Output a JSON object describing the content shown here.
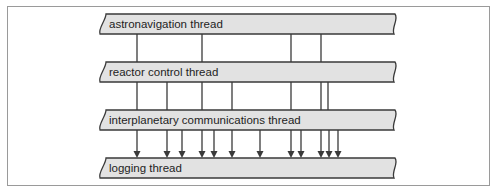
{
  "diagram": {
    "threads": [
      {
        "label": "astronavigation thread",
        "y": 14
      },
      {
        "label": "reactor control thread",
        "y": 62
      },
      {
        "label": "interplanetary communications thread",
        "y": 110
      },
      {
        "label": "logging thread",
        "y": 158
      }
    ],
    "connections": [
      {
        "from": 0,
        "to": 1,
        "x": [
          137,
          202,
          291,
          321
        ],
        "arrows": false
      },
      {
        "from": 1,
        "to": 2,
        "x": [
          137,
          167,
          202,
          232,
          291,
          321,
          328
        ],
        "arrows": false
      },
      {
        "from": 2,
        "to": 3,
        "x": [
          137,
          167,
          182,
          202,
          214,
          232,
          260,
          291,
          301,
          321,
          329,
          338
        ],
        "arrows": true
      }
    ],
    "colors": {
      "bar_fill": "#e2e2e2",
      "bar_stroke": "#3a3a3a",
      "line": "#3a3a3a",
      "frame": "#9a9a9a"
    }
  }
}
